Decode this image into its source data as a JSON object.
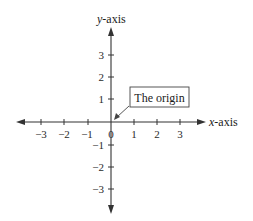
{
  "diagram": {
    "type": "coordinate-axes",
    "x_axis": {
      "label_var": "x",
      "label_suffix": "-axis",
      "ticks": [
        {
          "value": -3,
          "label": "−3"
        },
        {
          "value": -2,
          "label": "−2"
        },
        {
          "value": -1,
          "label": "−1"
        },
        {
          "value": 1,
          "label": "1"
        },
        {
          "value": 2,
          "label": "2"
        },
        {
          "value": 3,
          "label": "3"
        }
      ]
    },
    "y_axis": {
      "label_var": "y",
      "label_suffix": "-axis",
      "ticks": [
        {
          "value": 3,
          "label": "3"
        },
        {
          "value": 2,
          "label": "2"
        },
        {
          "value": 1,
          "label": "1"
        },
        {
          "value": -1,
          "label": "−1"
        },
        {
          "value": -2,
          "label": "−2"
        },
        {
          "value": -3,
          "label": "−3"
        }
      ]
    },
    "origin_label": "0",
    "callout": {
      "text": "The origin"
    },
    "colors": {
      "axis": "#333333",
      "text": "#1a1a1a",
      "background": "#ffffff"
    }
  }
}
